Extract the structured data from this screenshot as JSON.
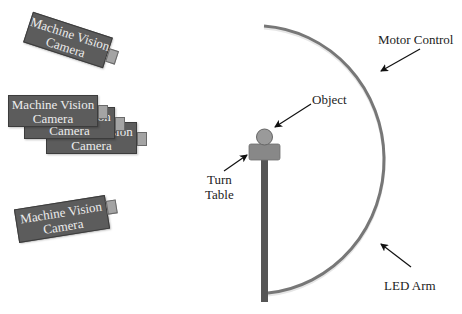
{
  "diagram": {
    "cameras": [
      {
        "line1": "Machine Vision",
        "line2": "Camera",
        "position": "top-angled"
      },
      {
        "line1": "Machine Vision",
        "line2": "Camera",
        "position": "stack-back"
      },
      {
        "line1": "Machine Vision",
        "line2": "Camera",
        "position": "stack-middle"
      },
      {
        "line1": "Machine Vision",
        "line2": "Camera",
        "position": "stack-front"
      },
      {
        "line1": "Machine Vision",
        "line2": "Camera",
        "position": "bottom-angled"
      }
    ],
    "labels": {
      "motor_control": "Motor Control",
      "object": "Object",
      "turn_table_line1": "Turn",
      "turn_table_line2": "Table",
      "led_arm": "LED Arm"
    }
  },
  "colors": {
    "camera_body": "#5c5c5c",
    "camera_lens": "#a4a4a4",
    "camera_text": "#ececec",
    "led_arm": "#777777",
    "pole": "#555555",
    "turn_table": "#888888",
    "object": "#9a9a9a",
    "label_text": "#222222"
  }
}
